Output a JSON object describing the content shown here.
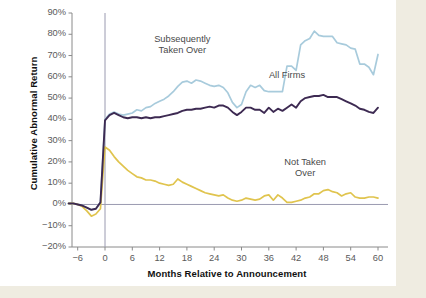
{
  "chart_data": {
    "type": "line",
    "title": "",
    "xlabel": "Months Relative to Announcement",
    "ylabel": "Cumulative Abnormal Return",
    "xlim": [
      -8,
      61
    ],
    "ylim": [
      -20,
      90
    ],
    "xticks": [
      -6,
      0,
      6,
      12,
      18,
      24,
      30,
      36,
      42,
      48,
      54,
      60
    ],
    "xtick_labels": [
      "−6",
      "0",
      "6",
      "12",
      "18",
      "24",
      "30",
      "36",
      "42",
      "48",
      "54",
      "60"
    ],
    "yticks": [
      -20,
      -10,
      0,
      10,
      20,
      30,
      40,
      50,
      60,
      70,
      80,
      90
    ],
    "ytick_labels": [
      "−20%",
      "−10%",
      "0%",
      "10%",
      "20%",
      "30%",
      "40%",
      "50%",
      "60%",
      "70%",
      "80%",
      "90%"
    ],
    "grid": false,
    "legend_position": "inline-annotations",
    "reference_lines": [
      {
        "name": "announcement-month",
        "orientation": "vertical",
        "value": 0,
        "color": "#9a9ab0"
      },
      {
        "name": "zero-return",
        "orientation": "horizontal",
        "value": 0,
        "color": "#9a9ab0"
      }
    ],
    "annotations": [
      {
        "name": "subsequently-taken-over-label",
        "text": "Subsequently\nTaken Over",
        "x": 17,
        "y": 75
      },
      {
        "name": "all-firms-label",
        "text": "All Firms",
        "x": 40,
        "y": 58
      },
      {
        "name": "not-taken-over-label",
        "text": "Not Taken\nOver",
        "x": 44,
        "y": 17
      }
    ],
    "colors": {
      "subsequently_taken_over": "#a8cbdc",
      "all_firms": "#3d2a52",
      "not_taken_over": "#e0c44e",
      "axis": "#8a8a8a",
      "reference_line": "#9a9ab0",
      "page_border": "#efece1",
      "plot_background": "#ffffff"
    },
    "x": [
      -8,
      -7,
      -6,
      -5,
      -4,
      -3,
      -2,
      -1,
      0,
      1,
      2,
      3,
      4,
      5,
      6,
      7,
      8,
      9,
      10,
      11,
      12,
      13,
      14,
      15,
      16,
      17,
      18,
      19,
      20,
      21,
      22,
      23,
      24,
      25,
      26,
      27,
      28,
      29,
      30,
      31,
      32,
      33,
      34,
      35,
      36,
      37,
      38,
      39,
      40,
      41,
      42,
      43,
      44,
      45,
      46,
      47,
      48,
      49,
      50,
      51,
      52,
      53,
      54,
      55,
      56,
      57,
      58,
      59,
      60
    ],
    "series": [
      {
        "name": "Subsequently Taken Over",
        "label": "Subsequently\nTaken Over",
        "color": "#a8cbdc",
        "values": [
          0.5,
          0.5,
          0.0,
          -0.5,
          -1.5,
          -2.5,
          -2.0,
          1.0,
          40.0,
          42.5,
          43.5,
          42.5,
          42.0,
          42.5,
          43.0,
          44.5,
          44.0,
          45.5,
          46.0,
          47.5,
          48.5,
          49.5,
          51.0,
          53.0,
          55.5,
          57.5,
          58.0,
          57.0,
          58.5,
          58.0,
          57.0,
          56.0,
          55.5,
          56.0,
          55.0,
          52.5,
          48.0,
          45.5,
          47.0,
          53.0,
          56.0,
          55.0,
          56.0,
          53.5,
          53.0,
          53.0,
          53.0,
          53.0,
          65.0,
          65.0,
          63.0,
          75.0,
          77.0,
          78.0,
          81.5,
          79.5,
          79.0,
          79.0,
          79.0,
          76.0,
          75.5,
          75.0,
          73.5,
          73.0,
          66.0,
          66.0,
          64.5,
          61.0,
          70.5
        ]
      },
      {
        "name": "All Firms",
        "label": "All Firms",
        "color": "#3d2a52",
        "values": [
          0.5,
          0.5,
          0.0,
          -0.5,
          -1.5,
          -2.5,
          -2.0,
          1.0,
          39.5,
          42.0,
          43.0,
          42.0,
          41.0,
          40.5,
          41.0,
          41.0,
          40.5,
          41.0,
          40.5,
          41.0,
          41.0,
          41.5,
          42.0,
          42.5,
          43.0,
          44.0,
          44.5,
          44.5,
          45.0,
          45.0,
          45.5,
          46.0,
          45.5,
          46.5,
          46.5,
          45.5,
          43.5,
          42.0,
          43.5,
          45.5,
          45.5,
          44.5,
          44.5,
          43.0,
          45.5,
          43.5,
          45.0,
          44.0,
          45.5,
          47.0,
          45.5,
          48.5,
          50.0,
          50.5,
          51.0,
          51.0,
          51.5,
          50.5,
          50.5,
          50.5,
          49.5,
          48.5,
          47.5,
          46.5,
          45.0,
          44.5,
          43.5,
          43.0,
          45.5
        ]
      },
      {
        "name": "Not Taken Over",
        "label": "Not Taken\nOver",
        "color": "#e0c44e",
        "values": [
          0.5,
          0.5,
          0.0,
          -1.0,
          -3.0,
          -5.5,
          -4.5,
          -2.0,
          27.0,
          25.5,
          22.5,
          20.0,
          18.0,
          16.0,
          14.5,
          13.0,
          12.5,
          11.5,
          11.5,
          11.0,
          10.0,
          9.5,
          9.0,
          9.5,
          12.0,
          10.5,
          9.5,
          8.5,
          7.5,
          6.5,
          5.5,
          5.0,
          4.5,
          4.0,
          4.5,
          3.0,
          2.0,
          1.5,
          2.0,
          3.0,
          2.5,
          2.0,
          2.5,
          4.0,
          4.5,
          2.0,
          4.5,
          3.0,
          1.0,
          1.0,
          1.5,
          2.0,
          3.0,
          3.5,
          5.0,
          5.0,
          6.5,
          7.0,
          6.0,
          5.5,
          4.0,
          5.0,
          5.5,
          3.5,
          3.0,
          3.0,
          3.5,
          3.5,
          3.0
        ]
      }
    ]
  }
}
